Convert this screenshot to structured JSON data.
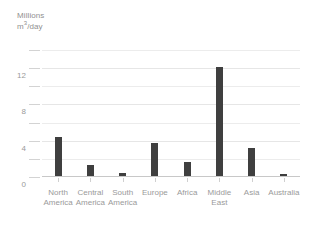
{
  "chart_data": {
    "type": "bar",
    "title": "",
    "axis_title_lines": [
      "Millions",
      "m3/day"
    ],
    "ylabel": "Millions m3/day",
    "xlabel": "",
    "categories": [
      "North America",
      "Central America",
      "South America",
      "Europe",
      "Africa",
      "Middle East",
      "Asia",
      "Australia"
    ],
    "category_lines": [
      [
        "North",
        "America"
      ],
      [
        "Central",
        "America"
      ],
      [
        "South",
        "America"
      ],
      [
        "Europe",
        ""
      ],
      [
        "Africa",
        ""
      ],
      [
        "Middle",
        "East"
      ],
      [
        "Asia",
        ""
      ],
      [
        "Australia",
        ""
      ]
    ],
    "values": [
      4.3,
      1.2,
      0.3,
      3.6,
      1.6,
      12.0,
      3.1,
      0.2
    ],
    "ylim": [
      0,
      14
    ],
    "ytick_labels": [
      "0",
      "4",
      "8",
      "12"
    ],
    "ytick_values": [
      0,
      4,
      8,
      12
    ],
    "minor_gridline_values": [
      2,
      6,
      10,
      14
    ],
    "grid": true,
    "legend": "none",
    "bar_color": "#3f3f3f",
    "gridline_color": "#ececec",
    "axis_color": "#c8c8c8",
    "text_color": "#9a9a9a",
    "background": "#ffffff"
  }
}
